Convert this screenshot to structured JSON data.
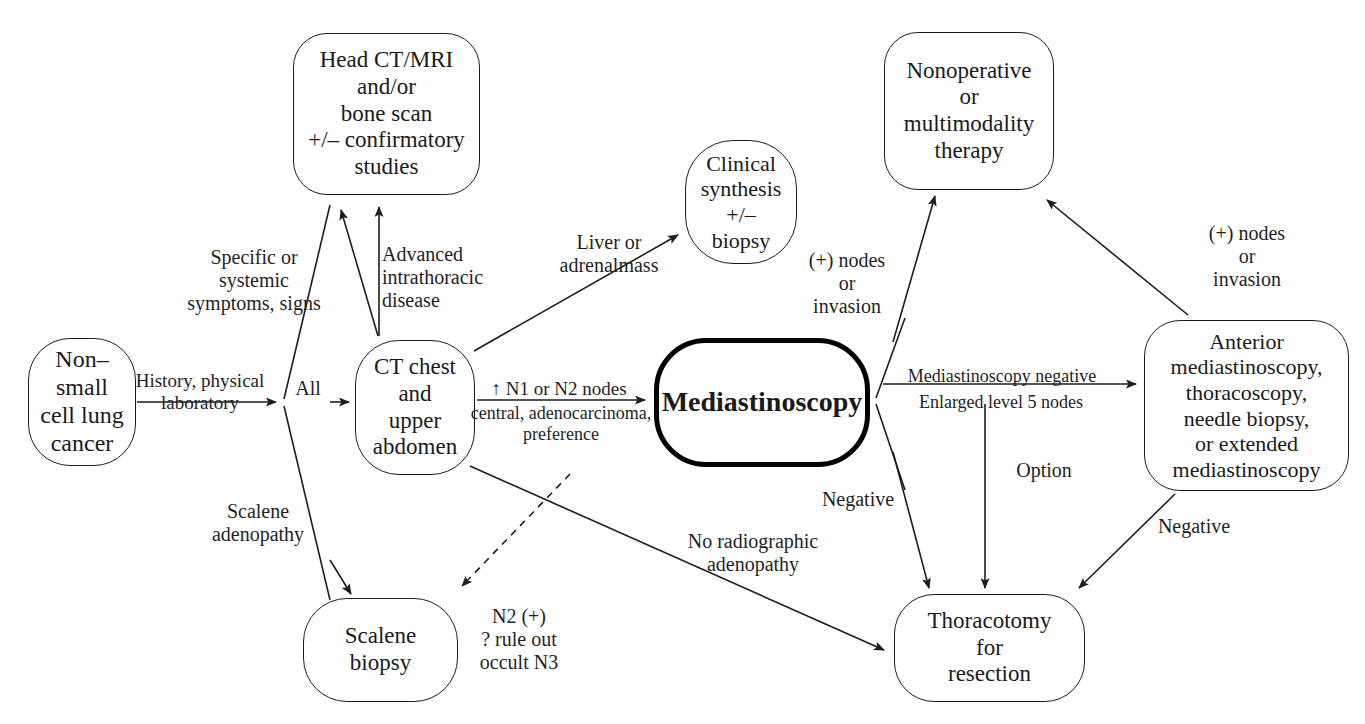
{
  "diagram": {
    "type": "clinical-flowchart",
    "width": 1365,
    "height": 724,
    "background_color": "#ffffff",
    "line_color": "#1d1d1d",
    "emphasis_color": "#000000"
  },
  "nodes": [
    {
      "id": "nsclc",
      "label": "Non–\nsmall\ncell lung\ncancer",
      "x": 28,
      "y": 338,
      "w": 108,
      "h": 128,
      "radius": 42,
      "font_size": 24,
      "emphasis": false
    },
    {
      "id": "head-ct-mri",
      "label": "Head CT/MRI\nand/or\nbone scan\n+/– confirmatory\nstudies",
      "x": 293,
      "y": 33,
      "w": 187,
      "h": 162,
      "radius": 34,
      "font_size": 23,
      "emphasis": false
    },
    {
      "id": "ct-chest-abdomen",
      "label": "CT chest\nand\nupper\nabdomen",
      "x": 355,
      "y": 340,
      "w": 120,
      "h": 135,
      "radius": 44,
      "font_size": 23,
      "emphasis": false
    },
    {
      "id": "scalene-biopsy",
      "label": "Scalene\nbiopsy",
      "x": 303,
      "y": 598,
      "w": 155,
      "h": 104,
      "radius": 44,
      "font_size": 23,
      "emphasis": false
    },
    {
      "id": "clinical-synthesis",
      "label": "Clinical\nsynthesis\n+/–\nbiopsy",
      "x": 685,
      "y": 140,
      "w": 112,
      "h": 124,
      "radius": 48,
      "font_size": 22,
      "emphasis": false
    },
    {
      "id": "mediastinoscopy",
      "label": "Mediastinoscopy",
      "x": 654,
      "y": 338,
      "w": 216,
      "h": 129,
      "radius": 52,
      "font_size": 28,
      "emphasis": true
    },
    {
      "id": "nonoperative-therapy",
      "label": "Nonoperative\nor\nmultimodality\ntherapy",
      "x": 884,
      "y": 32,
      "w": 170,
      "h": 158,
      "radius": 34,
      "font_size": 23,
      "emphasis": false
    },
    {
      "id": "anterior-mediastinoscopy",
      "label": "Anterior\nmediastinoscopy,\nthoracoscopy,\nneedle biopsy,\nor extended\nmediastinoscopy",
      "x": 1144,
      "y": 320,
      "w": 205,
      "h": 171,
      "radius": 36,
      "font_size": 22,
      "emphasis": false
    },
    {
      "id": "thoracotomy",
      "label": "Thoracotomy\nfor\nresection",
      "x": 894,
      "y": 594,
      "w": 191,
      "h": 108,
      "radius": 40,
      "font_size": 23,
      "emphasis": false
    }
  ],
  "edge_labels": [
    {
      "id": "history-physical-laboratory",
      "text": "History, physical\nlaboratory",
      "x": 130,
      "y": 370,
      "w": 140,
      "font_size": 19,
      "align": "center"
    },
    {
      "id": "specific-systemic-symptoms",
      "text": "Specific or\nsystemic\nsymptoms, signs",
      "x": 178,
      "y": 246,
      "w": 152,
      "font_size": 20,
      "align": "center"
    },
    {
      "id": "advanced-intrathoracic-disease",
      "text": "Advanced\nintrathoracic\ndisease",
      "x": 382,
      "y": 243,
      "w": 120,
      "font_size": 20,
      "align": "left"
    },
    {
      "id": "all",
      "text": "All",
      "x": 288,
      "y": 377,
      "w": 40,
      "font_size": 20,
      "align": "center"
    },
    {
      "id": "scalene-adenopathy",
      "text": "Scalene\nadenopathy",
      "x": 196,
      "y": 500,
      "w": 124,
      "font_size": 20,
      "align": "center"
    },
    {
      "id": "liver-adrenal-mass",
      "text": "Liver or\nadrenalmass",
      "x": 540,
      "y": 231,
      "w": 138,
      "font_size": 20,
      "align": "center"
    },
    {
      "id": "n1-n2-nodes",
      "text": "↑ N1 or N2 nodes",
      "x": 479,
      "y": 378,
      "w": 160,
      "font_size": 19,
      "align": "center"
    },
    {
      "id": "central-adenocarcinoma-preference",
      "text": "central, adenocarcinoma,\npreference",
      "x": 466,
      "y": 403,
      "w": 190,
      "font_size": 18,
      "align": "center"
    },
    {
      "id": "n2-positive-rule-out-occult-n3",
      "text": "N2 (+)\n? rule out\noccult N3",
      "x": 464,
      "y": 605,
      "w": 110,
      "font_size": 20,
      "align": "center"
    },
    {
      "id": "no-radiographic-adenopathy",
      "text": "No radiographic\nadenopathy",
      "x": 668,
      "y": 530,
      "w": 170,
      "font_size": 20,
      "align": "center"
    },
    {
      "id": "positive-nodes-or-invasion-left",
      "text": "(+) nodes\nor\ninvasion",
      "x": 796,
      "y": 249,
      "w": 102,
      "font_size": 20,
      "align": "center"
    },
    {
      "id": "negative-left",
      "text": "Negative",
      "x": 812,
      "y": 488,
      "w": 92,
      "font_size": 20,
      "align": "center"
    },
    {
      "id": "mediastinoscopy-negative",
      "text": "Mediastinoscopy negative",
      "x": 897,
      "y": 366,
      "w": 210,
      "font_size": 18,
      "align": "center"
    },
    {
      "id": "enlarged-level-5-nodes",
      "text": "Enlarged level 5 nodes",
      "x": 903,
      "y": 392,
      "w": 196,
      "font_size": 18,
      "align": "center"
    },
    {
      "id": "option",
      "text": "Option",
      "x": 1004,
      "y": 459,
      "w": 80,
      "font_size": 20,
      "align": "center"
    },
    {
      "id": "positive-nodes-or-invasion-right",
      "text": "(+) nodes\nor\ninvasion",
      "x": 1196,
      "y": 222,
      "w": 102,
      "font_size": 20,
      "align": "center"
    },
    {
      "id": "negative-right",
      "text": "Negative",
      "x": 1148,
      "y": 515,
      "w": 92,
      "font_size": 20,
      "align": "center"
    }
  ],
  "caption": {
    "text": "",
    "x": 0,
    "y": 706,
    "font_size": 15
  }
}
